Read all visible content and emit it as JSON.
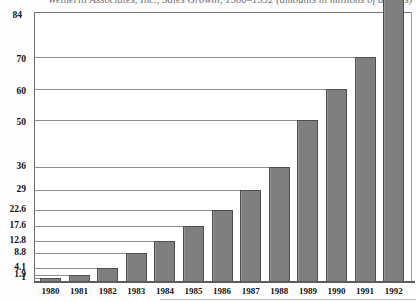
{
  "chart_data": {
    "type": "bar",
    "title": "Wetherill Associates, Inc., Sales Growth, 1980–1992 (amounts in millions of dollars)",
    "xlabel": "",
    "ylabel": "",
    "categories": [
      "1980",
      "1981",
      "1982",
      "1983",
      "1984",
      "1985",
      "1986",
      "1987",
      "1988",
      "1989",
      "1990",
      "1991",
      "1992"
    ],
    "values": [
      1,
      1.9,
      4.1,
      8.8,
      12.8,
      17.6,
      22.6,
      29,
      36,
      51,
      61,
      71,
      92
    ],
    "ylim": [
      0,
      84
    ],
    "ytick_labels": [
      "84",
      "70",
      "60",
      "50",
      "36",
      "29",
      "22.6",
      "17.6",
      "12.8",
      "8.8",
      "4.1",
      "1.9",
      "1"
    ],
    "ytick_values": [
      84,
      70,
      60,
      50,
      36,
      29,
      22.6,
      17.6,
      12.8,
      8.8,
      4.1,
      1.9,
      1
    ],
    "grid": true,
    "legend": "none",
    "bar_color": "#807f80",
    "bar_edge_color": "#4f4e4f",
    "grid_color": "#8d8d8a",
    "axis_color": "#5d5d5d",
    "background": "#ffffff"
  }
}
